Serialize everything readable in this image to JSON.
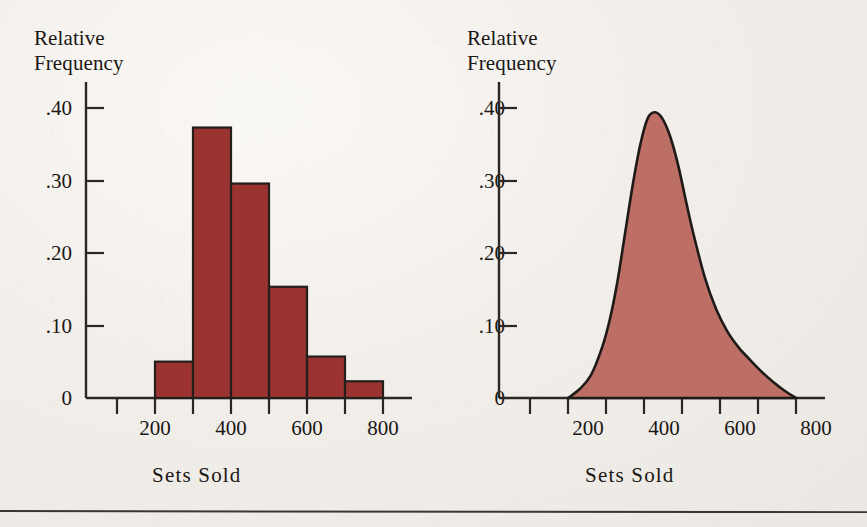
{
  "figure": {
    "background_color": "#efece8",
    "ink_color": "#1a1714",
    "footer_rule": true
  },
  "panels": [
    {
      "id": "histogram",
      "y_axis_title_line1": "Relative",
      "y_axis_title_line2": "Frequency",
      "x_axis_title": "Sets Sold",
      "y_tick_labels": [
        ".40",
        ".30",
        ".20",
        ".10",
        "0"
      ],
      "x_tick_labels": [
        "200",
        "400",
        "600",
        "800"
      ],
      "fill_color": "#9b3430",
      "line_color": "#231f1d"
    },
    {
      "id": "smooth-curve",
      "y_axis_title_line1": "Relative",
      "y_axis_title_line2": "Frequency",
      "x_axis_title": "Sets Sold",
      "y_tick_labels": [
        ".40",
        ".30",
        ".20",
        ".10",
        "0"
      ],
      "x_tick_labels": [
        "200",
        "400",
        "600",
        "800"
      ],
      "fill_color": "#bd6f66",
      "line_color": "#1d1a18"
    }
  ],
  "chart_data": [
    {
      "type": "bar",
      "title": "",
      "xlabel": "Sets Sold",
      "ylabel": "Relative Frequency",
      "categories": [
        "200-300",
        "300-400",
        "400-500",
        "500-600",
        "600-700",
        "700-800"
      ],
      "bin_edges": [
        200,
        300,
        400,
        500,
        600,
        700,
        800
      ],
      "values": [
        0.05,
        0.372,
        0.295,
        0.153,
        0.057,
        0.023
      ],
      "xlim": [
        100,
        800
      ],
      "ylim": [
        0,
        0.44
      ],
      "x_ticks": [
        100,
        200,
        300,
        400,
        500,
        600,
        700,
        800
      ],
      "x_tick_labels": [
        "",
        "200",
        "",
        "400",
        "",
        "600",
        "",
        "800"
      ],
      "y_ticks": [
        0,
        0.1,
        0.2,
        0.3,
        0.4
      ],
      "y_tick_labels": [
        "0",
        ".10",
        ".20",
        ".30",
        ".40"
      ],
      "grid": false,
      "legend": "none",
      "fill_color": "#9b3430",
      "edge_color": "#231f1d"
    },
    {
      "type": "area",
      "title": "",
      "xlabel": "Sets Sold",
      "ylabel": "Relative Frequency",
      "x": [
        200,
        230,
        260,
        290,
        310,
        330,
        350,
        370,
        390,
        410,
        430,
        450,
        470,
        490,
        510,
        530,
        560,
        590,
        620,
        650,
        680,
        710,
        740,
        770,
        800
      ],
      "y": [
        0.0,
        0.012,
        0.031,
        0.07,
        0.108,
        0.16,
        0.226,
        0.292,
        0.348,
        0.385,
        0.393,
        0.383,
        0.358,
        0.32,
        0.272,
        0.226,
        0.166,
        0.122,
        0.091,
        0.069,
        0.052,
        0.036,
        0.022,
        0.01,
        0.0
      ],
      "peak_x": 420,
      "peak_y": 0.393,
      "xlim": [
        100,
        800
      ],
      "ylim": [
        0,
        0.44
      ],
      "x_ticks": [
        100,
        200,
        300,
        400,
        500,
        600,
        700,
        800
      ],
      "x_tick_labels": [
        "",
        "200",
        "",
        "400",
        "",
        "600",
        "",
        "800"
      ],
      "y_ticks": [
        0,
        0.1,
        0.2,
        0.3,
        0.4
      ],
      "y_tick_labels": [
        "0",
        ".10",
        ".20",
        ".30",
        ".40"
      ],
      "grid": false,
      "legend": "none",
      "fill_color": "#bd6f66",
      "edge_color": "#1d1a18"
    }
  ]
}
